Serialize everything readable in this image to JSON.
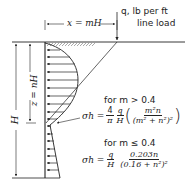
{
  "diagram": {
    "load_label_line1": "q, lb per ft",
    "load_label_line2": "line load",
    "x_dimension": "x = mH",
    "z_dimension": "z = nH",
    "h_dimension": "H",
    "case1": {
      "condition": "for m > 0.4",
      "lhs": "σh =",
      "coef_num": "4",
      "coef_den": "π",
      "q_num": "q",
      "q_den": "H",
      "numerator": "m²n",
      "denominator": "(m² + n²)²"
    },
    "case2": {
      "condition": "for m ≤ 0.4",
      "lhs": "σh =",
      "q_num": "q",
      "q_den": "H",
      "numerator": "0.203n",
      "denominator": "(0.16 + n²)²"
    }
  }
}
